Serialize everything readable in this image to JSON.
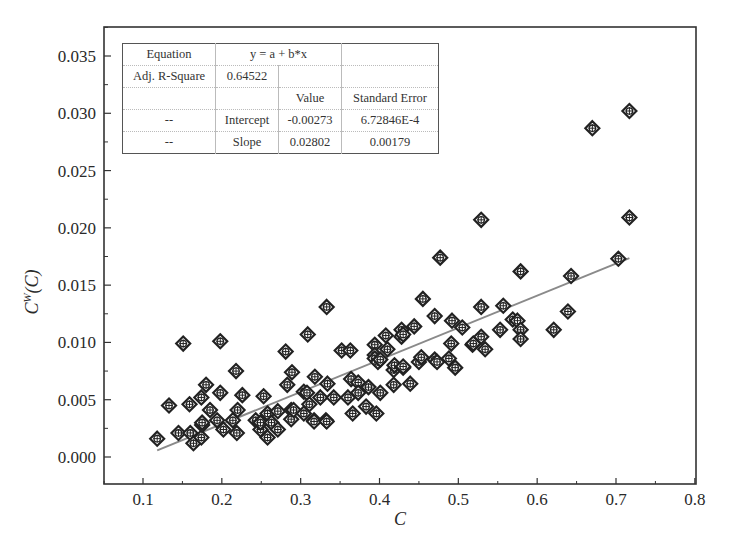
{
  "chart_data": {
    "type": "scatter",
    "title": "",
    "xlabel": "C",
    "ylabel": "C^W(C)",
    "xlim": [
      0.05,
      0.8
    ],
    "ylim": [
      -0.0023,
      0.037
    ],
    "xticks": [
      0.1,
      0.2,
      0.3,
      0.4,
      0.5,
      0.6,
      0.7,
      0.8
    ],
    "xtick_labels": [
      "0.1",
      "0.2",
      "0.3",
      "0.4",
      "0.5",
      "0.6",
      "0.7",
      "0.8"
    ],
    "yticks": [
      0.0,
      0.005,
      0.01,
      0.015,
      0.02,
      0.025,
      0.03,
      0.035
    ],
    "ytick_labels": [
      "0.000",
      "0.005",
      "0.010",
      "0.015",
      "0.020",
      "0.025",
      "0.030",
      "0.035"
    ],
    "grid": false,
    "marker": "diamond-crosshair",
    "series": [
      {
        "name": "data",
        "points": [
          [
            0.118,
            0.0016
          ],
          [
            0.133,
            0.0045
          ],
          [
            0.145,
            0.0021
          ],
          [
            0.151,
            0.0099
          ],
          [
            0.159,
            0.0046
          ],
          [
            0.16,
            0.0021
          ],
          [
            0.164,
            0.0012
          ],
          [
            0.174,
            0.0017
          ],
          [
            0.174,
            0.0052
          ],
          [
            0.175,
            0.0028
          ],
          [
            0.175,
            0.003
          ],
          [
            0.18,
            0.0063
          ],
          [
            0.185,
            0.0041
          ],
          [
            0.194,
            0.0032
          ],
          [
            0.198,
            0.0101
          ],
          [
            0.198,
            0.0056
          ],
          [
            0.202,
            0.0024
          ],
          [
            0.214,
            0.0032
          ],
          [
            0.218,
            0.0075
          ],
          [
            0.219,
            0.0021
          ],
          [
            0.22,
            0.0041
          ],
          [
            0.226,
            0.0054
          ],
          [
            0.243,
            0.0032
          ],
          [
            0.249,
            0.0024
          ],
          [
            0.249,
            0.003
          ],
          [
            0.253,
            0.0053
          ],
          [
            0.258,
            0.0038
          ],
          [
            0.258,
            0.0017
          ],
          [
            0.263,
            0.003
          ],
          [
            0.271,
            0.004
          ],
          [
            0.271,
            0.0024
          ],
          [
            0.281,
            0.0092
          ],
          [
            0.283,
            0.0063
          ],
          [
            0.288,
            0.0041
          ],
          [
            0.288,
            0.0033
          ],
          [
            0.289,
            0.0074
          ],
          [
            0.291,
            0.0041
          ],
          [
            0.304,
            0.0038
          ],
          [
            0.304,
            0.0057
          ],
          [
            0.308,
            0.0056
          ],
          [
            0.309,
            0.0107
          ],
          [
            0.311,
            0.0046
          ],
          [
            0.317,
            0.0032
          ],
          [
            0.317,
            0.0031
          ],
          [
            0.318,
            0.007
          ],
          [
            0.325,
            0.0052
          ],
          [
            0.332,
            0.0032
          ],
          [
            0.333,
            0.0131
          ],
          [
            0.333,
            0.0031
          ],
          [
            0.334,
            0.0064
          ],
          [
            0.342,
            0.0052
          ],
          [
            0.352,
            0.0093
          ],
          [
            0.36,
            0.0052
          ],
          [
            0.363,
            0.0093
          ],
          [
            0.364,
            0.0068
          ],
          [
            0.366,
            0.0038
          ],
          [
            0.373,
            0.0065
          ],
          [
            0.373,
            0.0056
          ],
          [
            0.383,
            0.0044
          ],
          [
            0.386,
            0.0061
          ],
          [
            0.394,
            0.0098
          ],
          [
            0.394,
            0.0089
          ],
          [
            0.394,
            0.0086
          ],
          [
            0.396,
            0.0038
          ],
          [
            0.398,
            0.0083
          ],
          [
            0.401,
            0.0085
          ],
          [
            0.401,
            0.0056
          ],
          [
            0.408,
            0.0106
          ],
          [
            0.41,
            0.0094
          ],
          [
            0.418,
            0.0076
          ],
          [
            0.418,
            0.0063
          ],
          [
            0.419,
            0.008
          ],
          [
            0.428,
            0.0111
          ],
          [
            0.428,
            0.0105
          ],
          [
            0.43,
            0.0107
          ],
          [
            0.43,
            0.0078
          ],
          [
            0.43,
            0.0079
          ],
          [
            0.439,
            0.0064
          ],
          [
            0.444,
            0.0114
          ],
          [
            0.45,
            0.0083
          ],
          [
            0.453,
            0.0087
          ],
          [
            0.455,
            0.0138
          ],
          [
            0.47,
            0.0123
          ],
          [
            0.47,
            0.0085
          ],
          [
            0.473,
            0.0083
          ],
          [
            0.477,
            0.0174
          ],
          [
            0.488,
            0.0086
          ],
          [
            0.491,
            0.0099
          ],
          [
            0.492,
            0.0119
          ],
          [
            0.496,
            0.0078
          ],
          [
            0.505,
            0.0113
          ],
          [
            0.518,
            0.0098
          ],
          [
            0.519,
            0.0099
          ],
          [
            0.529,
            0.0207
          ],
          [
            0.529,
            0.0131
          ],
          [
            0.529,
            0.0105
          ],
          [
            0.534,
            0.0094
          ],
          [
            0.553,
            0.0111
          ],
          [
            0.557,
            0.0132
          ],
          [
            0.569,
            0.012
          ],
          [
            0.575,
            0.0119
          ],
          [
            0.579,
            0.0162
          ],
          [
            0.579,
            0.0111
          ],
          [
            0.579,
            0.0103
          ],
          [
            0.621,
            0.0111
          ],
          [
            0.639,
            0.0127
          ],
          [
            0.643,
            0.0158
          ],
          [
            0.67,
            0.0287
          ],
          [
            0.703,
            0.0173
          ],
          [
            0.717,
            0.0302
          ],
          [
            0.717,
            0.0209
          ]
        ]
      }
    ],
    "fit": {
      "type": "linear",
      "intercept": -0.00273,
      "slope": 0.02802,
      "x_range": [
        0.118,
        0.717
      ]
    },
    "annotations": [
      {
        "type": "stats-table",
        "position": "top-left"
      }
    ]
  },
  "stats_table": {
    "rows": [
      [
        "Equation",
        "y = a + b*x",
        ""
      ],
      [
        "Adj. R-Square",
        "0.64522",
        "",
        ""
      ],
      [
        "",
        "",
        "Value",
        "Standard Error"
      ],
      [
        "--",
        "Intercept",
        "-0.00273",
        "6.72846E-4"
      ],
      [
        "--",
        "Slope",
        "0.02802",
        "0.00179"
      ]
    ]
  },
  "colors": {
    "marker": "#222222",
    "fit_line": "#8a8a8a",
    "axis": "#333333"
  }
}
